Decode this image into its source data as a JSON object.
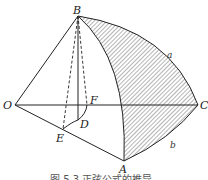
{
  "figure": {
    "points": {
      "O": "O",
      "B": "B",
      "C": "C",
      "A": "A",
      "E": "E",
      "D": "D",
      "F": "F"
    },
    "arcs": {
      "a": "a",
      "b": "b"
    },
    "caption": "图 5.3   正弦公式的推导"
  }
}
